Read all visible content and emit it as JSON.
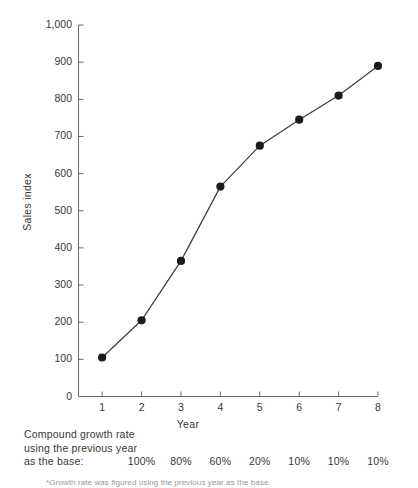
{
  "chart_data": {
    "type": "line",
    "title": "",
    "subtitle": "",
    "xlabel": "Year",
    "ylabel": "Sales index",
    "x": [
      1,
      2,
      3,
      4,
      5,
      6,
      7,
      8
    ],
    "categories": [
      "1",
      "2",
      "3",
      "4",
      "5",
      "6",
      "7",
      "8"
    ],
    "values": [
      105,
      205,
      365,
      565,
      675,
      745,
      810,
      890
    ],
    "series": [
      {
        "name": "Sales index",
        "values": [
          105,
          205,
          365,
          565,
          675,
          745,
          810,
          890
        ]
      }
    ],
    "xlim": [
      0.4,
      8.0
    ],
    "ylim": [
      0,
      1000
    ],
    "ytick_labels": [
      "0",
      "100",
      "200",
      "300",
      "400",
      "500",
      "600",
      "700",
      "800",
      "900",
      "1,000"
    ],
    "ytick_values": [
      0,
      100,
      200,
      300,
      400,
      500,
      600,
      700,
      800,
      900,
      1000
    ],
    "xtick_labels": [
      "1",
      "2",
      "3",
      "4",
      "5",
      "6",
      "7",
      "8"
    ],
    "xtick_values": [
      1,
      2,
      3,
      4,
      5,
      6,
      7,
      8
    ],
    "grid": false,
    "legend": false,
    "marker": "filled-circle",
    "line_color": "#3d3a38",
    "marker_color": "#1d1b1a",
    "axis_color": "#6e6b68"
  },
  "annotations": {
    "growth_label_line1": "Compound growth rate",
    "growth_label_line2": "using the previous year",
    "growth_label_line3": "as the base:",
    "growth_rates": [
      "100%",
      "80%",
      "60%",
      "20%",
      "10%",
      "10%",
      "10%"
    ],
    "footnote": "*Growth rate was figured using the previous year as the base."
  }
}
